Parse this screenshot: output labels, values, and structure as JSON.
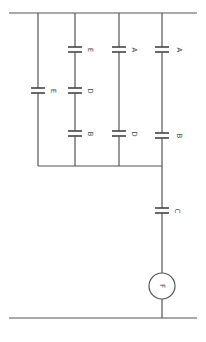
{
  "diagram": {
    "type": "capacitor-circuit",
    "orientation": "rotated-90deg",
    "colors": {
      "wire": "#555555",
      "background": "#ffffff"
    },
    "capacitors": [
      {
        "id": "cap-a-right",
        "label": "A"
      },
      {
        "id": "cap-b-right",
        "label": "B"
      },
      {
        "id": "cap-a-mid",
        "label": "A"
      },
      {
        "id": "cap-d-mid",
        "label": "D"
      },
      {
        "id": "cap-e-upper",
        "label": "E"
      },
      {
        "id": "cap-d-upper",
        "label": "D"
      },
      {
        "id": "cap-b-upper",
        "label": "B"
      },
      {
        "id": "cap-e-left",
        "label": "E"
      },
      {
        "id": "cap-c",
        "label": "C"
      }
    ],
    "source": {
      "label": "F"
    }
  }
}
